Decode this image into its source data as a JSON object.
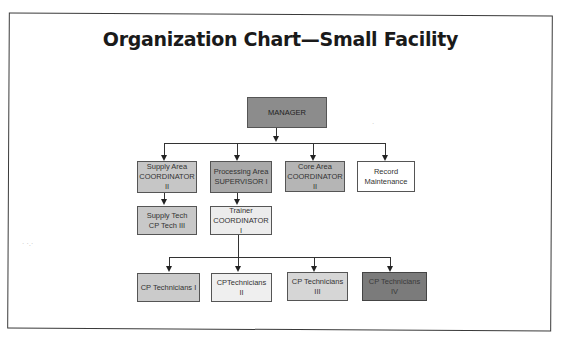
{
  "title": "Organization Chart—Small Facility",
  "nodes": {
    "manager": {
      "label": "MANAGER",
      "fill": "#8c8c8c"
    },
    "supply_area": {
      "label": "Supply Area\nCOORDINATOR II",
      "fill": "#c6c6c6"
    },
    "processing_area": {
      "label": "Processing Area\nSUPERVISOR I",
      "fill": "#a9a9a9"
    },
    "core_area": {
      "label": "Core Area\nCOORDINATOR II",
      "fill": "#b5b5b5"
    },
    "record_maintenance": {
      "label": "Record\nMaintenance",
      "fill": "#ffffff"
    },
    "supply_tech": {
      "label": "Supply Tech\nCP Tech III",
      "fill": "#c8c8c8"
    },
    "trainer": {
      "label": "Trainer\nCOORDINATOR I",
      "fill": "#ececec"
    },
    "cp_tech_1": {
      "label": "CP Technicians I",
      "fill": "#cbcbcb"
    },
    "cp_tech_2": {
      "label": "CPTechnicians II",
      "fill": "#efefef"
    },
    "cp_tech_3": {
      "label": "CP Technicians III",
      "fill": "#d6d6d6"
    },
    "cp_tech_4": {
      "label": "CP Technicians IV",
      "fill": "#7b7b7b"
    }
  },
  "edges": [
    [
      "manager",
      "supply_area"
    ],
    [
      "manager",
      "processing_area"
    ],
    [
      "manager",
      "core_area"
    ],
    [
      "manager",
      "record_maintenance"
    ],
    [
      "supply_area",
      "supply_tech"
    ],
    [
      "processing_area",
      "trainer"
    ],
    [
      "trainer",
      "cp_tech_1"
    ],
    [
      "trainer",
      "cp_tech_2"
    ],
    [
      "trainer",
      "cp_tech_3"
    ],
    [
      "trainer",
      "cp_tech_4"
    ]
  ]
}
